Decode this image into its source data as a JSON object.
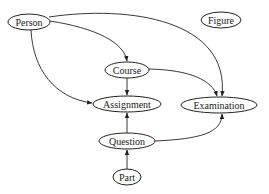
{
  "diagram": {
    "type": "directed-graph",
    "nodes": [
      {
        "id": "person",
        "label": "Person",
        "cx": 29,
        "cy": 22,
        "rx": 21,
        "ry": 8
      },
      {
        "id": "figure",
        "label": "Figure",
        "cx": 221,
        "cy": 20,
        "rx": 20,
        "ry": 8
      },
      {
        "id": "course",
        "label": "Course",
        "cx": 127,
        "cy": 70,
        "rx": 22,
        "ry": 8
      },
      {
        "id": "assignment",
        "label": "Assignment",
        "cx": 127,
        "cy": 104,
        "rx": 34,
        "ry": 8
      },
      {
        "id": "examination",
        "label": "Examination",
        "cx": 219,
        "cy": 105,
        "rx": 38,
        "ry": 8
      },
      {
        "id": "question",
        "label": "Question",
        "cx": 127,
        "cy": 141,
        "rx": 28,
        "ry": 8
      },
      {
        "id": "part",
        "label": "Part",
        "cx": 127,
        "cy": 177,
        "rx": 14,
        "ry": 8
      }
    ],
    "edges": [
      {
        "from": "person",
        "to": "course"
      },
      {
        "from": "person",
        "to": "assignment"
      },
      {
        "from": "person",
        "to": "examination"
      },
      {
        "from": "course",
        "to": "assignment"
      },
      {
        "from": "course",
        "to": "examination"
      },
      {
        "from": "question",
        "to": "assignment"
      },
      {
        "from": "question",
        "to": "examination"
      },
      {
        "from": "part",
        "to": "question"
      }
    ]
  }
}
